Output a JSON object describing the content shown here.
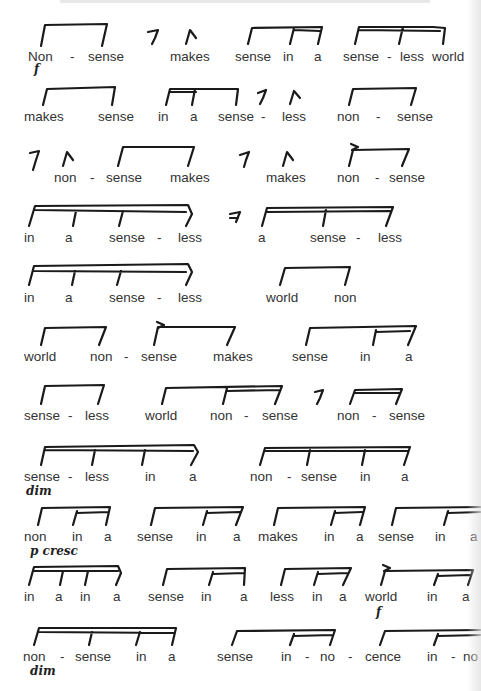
{
  "page": {
    "type": "speech-rhythm score",
    "header_text_visible": false
  },
  "rows": [
    {
      "y": 50,
      "words": [
        {
          "t": "Non",
          "x": 28
        },
        {
          "t": "-",
          "x": 70
        },
        {
          "t": "sense",
          "x": 88
        },
        {
          "t": "makes",
          "x": 170
        },
        {
          "t": "sense",
          "x": 235
        },
        {
          "t": "in",
          "x": 283
        },
        {
          "t": "a",
          "x": 314
        },
        {
          "t": "sense",
          "x": 343
        },
        {
          "t": "-",
          "x": 387
        },
        {
          "t": "less",
          "x": 400
        },
        {
          "t": "world",
          "x": 432
        }
      ],
      "marks": [
        {
          "t": "f",
          "x": 34,
          "y": 62
        }
      ]
    },
    {
      "y": 110,
      "words": [
        {
          "t": "makes",
          "x": 24
        },
        {
          "t": "sense",
          "x": 98
        },
        {
          "t": "in",
          "x": 158
        },
        {
          "t": "a",
          "x": 190
        },
        {
          "t": "sense",
          "x": 218
        },
        {
          "t": "-",
          "x": 261
        },
        {
          "t": "less",
          "x": 282
        },
        {
          "t": "non",
          "x": 337
        },
        {
          "t": "-",
          "x": 376
        },
        {
          "t": "sense",
          "x": 397
        }
      ],
      "marks": []
    },
    {
      "y": 171,
      "words": [
        {
          "t": "non",
          "x": 54
        },
        {
          "t": "-",
          "x": 90
        },
        {
          "t": "sense",
          "x": 106
        },
        {
          "t": "makes",
          "x": 170
        },
        {
          "t": "makes",
          "x": 266
        },
        {
          "t": "non",
          "x": 337
        },
        {
          "t": "-",
          "x": 375
        },
        {
          "t": "sense",
          "x": 389
        }
      ],
      "marks": []
    },
    {
      "y": 231,
      "words": [
        {
          "t": "in",
          "x": 24
        },
        {
          "t": "a",
          "x": 65
        },
        {
          "t": "sense",
          "x": 109
        },
        {
          "t": "-",
          "x": 157
        },
        {
          "t": "less",
          "x": 178
        },
        {
          "t": "a",
          "x": 258
        },
        {
          "t": "sense",
          "x": 310
        },
        {
          "t": "-",
          "x": 356
        },
        {
          "t": "less",
          "x": 378
        }
      ],
      "marks": []
    },
    {
      "y": 291,
      "words": [
        {
          "t": "in",
          "x": 24
        },
        {
          "t": "a",
          "x": 65
        },
        {
          "t": "sense",
          "x": 109
        },
        {
          "t": "-",
          "x": 157
        },
        {
          "t": "less",
          "x": 178
        },
        {
          "t": "world",
          "x": 266
        },
        {
          "t": "non",
          "x": 334
        }
      ],
      "marks": []
    },
    {
      "y": 350,
      "words": [
        {
          "t": "world",
          "x": 24
        },
        {
          "t": "non",
          "x": 90
        },
        {
          "t": "-",
          "x": 124
        },
        {
          "t": "sense",
          "x": 141
        },
        {
          "t": "makes",
          "x": 213
        },
        {
          "t": "sense",
          "x": 292
        },
        {
          "t": "in",
          "x": 360
        },
        {
          "t": "a",
          "x": 405
        }
      ],
      "marks": []
    },
    {
      "y": 409,
      "words": [
        {
          "t": "sense",
          "x": 24
        },
        {
          "t": "-",
          "x": 68
        },
        {
          "t": "less",
          "x": 85
        },
        {
          "t": "world",
          "x": 145
        },
        {
          "t": "non",
          "x": 210
        },
        {
          "t": "-",
          "x": 244
        },
        {
          "t": "sense",
          "x": 262
        },
        {
          "t": "non",
          "x": 337
        },
        {
          "t": "-",
          "x": 372
        },
        {
          "t": "sense",
          "x": 389
        }
      ],
      "marks": []
    },
    {
      "y": 470,
      "words": [
        {
          "t": "sense",
          "x": 24
        },
        {
          "t": "-",
          "x": 68
        },
        {
          "t": "less",
          "x": 85
        },
        {
          "t": "in",
          "x": 145
        },
        {
          "t": "a",
          "x": 189
        },
        {
          "t": "non",
          "x": 250
        },
        {
          "t": "-",
          "x": 287
        },
        {
          "t": "sense",
          "x": 301
        },
        {
          "t": "in",
          "x": 360
        },
        {
          "t": "a",
          "x": 401
        }
      ],
      "marks": [
        {
          "t": "dim",
          "x": 26,
          "y": 484
        }
      ]
    },
    {
      "y": 530,
      "words": [
        {
          "t": "non",
          "x": 24
        },
        {
          "t": "in",
          "x": 72
        },
        {
          "t": "a",
          "x": 104
        },
        {
          "t": "sense",
          "x": 137
        },
        {
          "t": "in",
          "x": 196
        },
        {
          "t": "a",
          "x": 233
        },
        {
          "t": "makes",
          "x": 258
        },
        {
          "t": "in",
          "x": 324
        },
        {
          "t": "a",
          "x": 356
        },
        {
          "t": "sense",
          "x": 378
        },
        {
          "t": "in",
          "x": 435
        },
        {
          "t": "a",
          "x": 470
        }
      ],
      "marks": [
        {
          "t": "p cresc",
          "x": 30,
          "y": 544
        }
      ]
    },
    {
      "y": 590,
      "words": [
        {
          "t": "in",
          "x": 24
        },
        {
          "t": "a",
          "x": 55
        },
        {
          "t": "in",
          "x": 80
        },
        {
          "t": "a",
          "x": 113
        },
        {
          "t": "sense",
          "x": 148
        },
        {
          "t": "in",
          "x": 201
        },
        {
          "t": "a",
          "x": 240
        },
        {
          "t": "less",
          "x": 270
        },
        {
          "t": "in",
          "x": 312
        },
        {
          "t": "a",
          "x": 339
        },
        {
          "t": "world",
          "x": 365
        },
        {
          "t": "in",
          "x": 427
        },
        {
          "t": "a",
          "x": 462
        }
      ],
      "marks": [
        {
          "t": "f",
          "x": 376,
          "y": 605
        }
      ]
    },
    {
      "y": 650,
      "words": [
        {
          "t": "non",
          "x": 23
        },
        {
          "t": "-",
          "x": 60
        },
        {
          "t": "sense",
          "x": 75
        },
        {
          "t": "in",
          "x": 136
        },
        {
          "t": "a",
          "x": 168
        },
        {
          "t": "sense",
          "x": 217
        },
        {
          "t": "in",
          "x": 281
        },
        {
          "t": "-",
          "x": 305
        },
        {
          "t": "no",
          "x": 320
        },
        {
          "t": "-",
          "x": 348
        },
        {
          "t": "cence",
          "x": 365
        },
        {
          "t": "in",
          "x": 427
        },
        {
          "t": "-",
          "x": 451
        },
        {
          "t": "no",
          "x": 463
        }
      ],
      "marks": [
        {
          "t": "dim",
          "x": 30,
          "y": 664
        }
      ]
    }
  ],
  "rest_symbols": [
    {
      "x": 146,
      "y": 30
    },
    {
      "x": 258,
      "y": 90
    },
    {
      "x": 32,
      "y": 150
    },
    {
      "x": 243,
      "y": 152
    },
    {
      "x": 232,
      "y": 212
    },
    {
      "x": 317,
      "y": 390
    },
    {
      "x": 257,
      "y": 88
    }
  ],
  "accent_marks": [
    {
      "x": 185,
      "y": 28
    },
    {
      "x": 288,
      "y": 88
    },
    {
      "x": 68,
      "y": 150
    },
    {
      "x": 283,
      "y": 150
    }
  ],
  "breath_marks": [
    {
      "x": 355,
      "y": 143
    },
    {
      "x": 158,
      "y": 324
    },
    {
      "x": 383,
      "y": 567
    }
  ]
}
